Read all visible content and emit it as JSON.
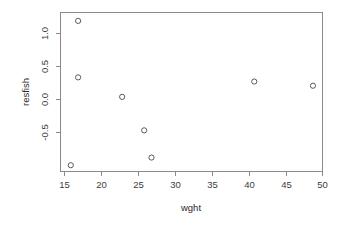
{
  "chart_data": {
    "type": "scatter",
    "title": "",
    "subtitle": "",
    "xlabel": "wght",
    "ylabel": "resfish",
    "xlim": [
      14.6,
      50.3
    ],
    "ylim": [
      -1.0,
      1.28
    ],
    "grid": false,
    "legend": null,
    "legend_position": "none",
    "xticks": [
      15,
      20,
      25,
      30,
      35,
      40,
      45,
      50
    ],
    "xtick_labels": [
      "15",
      "20",
      "25",
      "30",
      "35",
      "40",
      "45",
      "50"
    ],
    "yticks": [
      -0.5,
      0.0,
      0.5,
      1.0
    ],
    "ytick_labels": [
      "-0.5",
      "0.0",
      "0.5",
      "1.0"
    ],
    "marker": "open-circle",
    "marker_color": "#5a5a5a",
    "x": [
      16,
      17,
      17,
      23,
      26,
      27,
      41,
      49
    ],
    "y": [
      -0.91,
      1.16,
      0.35,
      0.07,
      -0.41,
      -0.8,
      0.29,
      0.23
    ],
    "points": [
      {
        "x": 16,
        "y": -0.91
      },
      {
        "x": 17,
        "y": 1.16
      },
      {
        "x": 17,
        "y": 0.35
      },
      {
        "x": 23,
        "y": 0.07
      },
      {
        "x": 26,
        "y": -0.41
      },
      {
        "x": 27,
        "y": -0.8
      },
      {
        "x": 41,
        "y": 0.29
      },
      {
        "x": 49,
        "y": 0.23
      }
    ]
  },
  "axes": {
    "frame_color": "#8a8a8a",
    "text_color": "#3d3d3d"
  }
}
